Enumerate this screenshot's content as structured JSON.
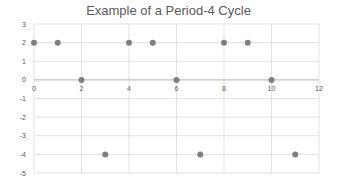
{
  "chart_data": {
    "type": "scatter",
    "title": "Example of a Period-4 Cycle",
    "xlabel": "",
    "ylabel": "",
    "xlim": [
      0,
      12
    ],
    "ylim": [
      -5,
      3
    ],
    "x_ticks": [
      0,
      2,
      4,
      6,
      8,
      10,
      12
    ],
    "y_ticks": [
      3,
      2,
      1,
      0,
      -1,
      -2,
      -3,
      -4,
      -5
    ],
    "grid": true,
    "legend": null,
    "series": [
      {
        "name": "Series1",
        "color": "#7f7f7f",
        "x": [
          0,
          1,
          2,
          3,
          4,
          5,
          6,
          7,
          8,
          9,
          10,
          11
        ],
        "y": [
          2,
          2,
          0,
          -4,
          2,
          2,
          0,
          -4,
          2,
          2,
          0,
          -4
        ]
      }
    ]
  },
  "colors": {
    "grid": "#d9d9d9",
    "axis": "#bfbfbf",
    "marker": "#7f7f7f",
    "text": "#595959"
  }
}
